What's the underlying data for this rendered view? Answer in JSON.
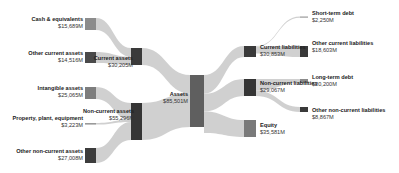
{
  "chart_data": {
    "type": "sankey",
    "title": "",
    "unit": "$M",
    "nodes": [
      {
        "id": "cash",
        "label": "Cash & equivalents",
        "value_text": "$15,689M",
        "value": 15689,
        "color": "#8c8c8c",
        "column": 0
      },
      {
        "id": "other_ca",
        "label": "Other current assets",
        "value_text": "$14,516M",
        "value": 14516,
        "color": "#4a4a4a",
        "column": 0
      },
      {
        "id": "intangible",
        "label": "Intangible assets",
        "value_text": "$25,065M",
        "value": 25065,
        "color": "#7d7d7d",
        "column": 0
      },
      {
        "id": "ppe",
        "label": "Property, plant, equipment",
        "value_text": "$3,223M",
        "value": 3223,
        "color": "#9a9a9a",
        "column": 0
      },
      {
        "id": "other_nca",
        "label": "Other non-current assets",
        "value_text": "$27,008M",
        "value": 27008,
        "color": "#3c3c3c",
        "column": 0
      },
      {
        "id": "current_assets",
        "label": "Current assets",
        "value_text": "$30,205M",
        "value": 30205,
        "color": "#3a3a3a",
        "column": 1
      },
      {
        "id": "noncurrent_assets",
        "label": "Non-current assets",
        "value_text": "$55,296M",
        "value": 55296,
        "color": "#353535",
        "column": 1
      },
      {
        "id": "assets",
        "label": "Assets",
        "value_text": "$85,501M",
        "value": 85501,
        "color": "#5f5f5f",
        "column": 2
      },
      {
        "id": "current_liab",
        "label": "Current liabilities",
        "value_text": "$30,853M",
        "value": 30853,
        "color": "#3a3a3a",
        "column": 3
      },
      {
        "id": "noncurrent_liab",
        "label": "Non-current liabilities",
        "value_text": "$29,067M",
        "value": 29067,
        "color": "#353535",
        "column": 3
      },
      {
        "id": "equity",
        "label": "Equity",
        "value_text": "$35,581M",
        "value": 35581,
        "color": "#7a7a7a",
        "column": 3
      },
      {
        "id": "short_debt",
        "label": "Short-term debt",
        "value_text": "$2,250M",
        "value": 2250,
        "color": "#9a9a9a",
        "column": 4
      },
      {
        "id": "other_cl",
        "label": "Other current liabilities",
        "value_text": "$18,603M",
        "value": 18603,
        "color": "#3a3a3a",
        "column": 4
      },
      {
        "id": "long_debt",
        "label": "Long-term debt",
        "value_text": "$20,200M",
        "value": 20200,
        "color": "#8a8a8a",
        "column": 4
      },
      {
        "id": "other_ncl",
        "label": "Other non-current liabilities",
        "value_text": "$8,867M",
        "value": 8867,
        "color": "#3a3a3a",
        "column": 4
      }
    ],
    "links": [
      {
        "source": "cash",
        "target": "current_assets",
        "value": 15689
      },
      {
        "source": "other_ca",
        "target": "current_assets",
        "value": 14516
      },
      {
        "source": "intangible",
        "target": "noncurrent_assets",
        "value": 25065
      },
      {
        "source": "ppe",
        "target": "noncurrent_assets",
        "value": 3223
      },
      {
        "source": "other_nca",
        "target": "noncurrent_assets",
        "value": 27008
      },
      {
        "source": "current_assets",
        "target": "assets",
        "value": 30205
      },
      {
        "source": "noncurrent_assets",
        "target": "assets",
        "value": 55296
      },
      {
        "source": "assets",
        "target": "current_liab",
        "value": 30853
      },
      {
        "source": "assets",
        "target": "noncurrent_liab",
        "value": 29067
      },
      {
        "source": "assets",
        "target": "equity",
        "value": 35581
      },
      {
        "source": "current_liab",
        "target": "short_debt",
        "value": 2250
      },
      {
        "source": "current_liab",
        "target": "other_cl",
        "value": 18603
      },
      {
        "source": "noncurrent_liab",
        "target": "long_debt",
        "value": 20200
      },
      {
        "source": "noncurrent_liab",
        "target": "other_ncl",
        "value": 8867
      }
    ],
    "link_color": "#c8c8c8"
  }
}
